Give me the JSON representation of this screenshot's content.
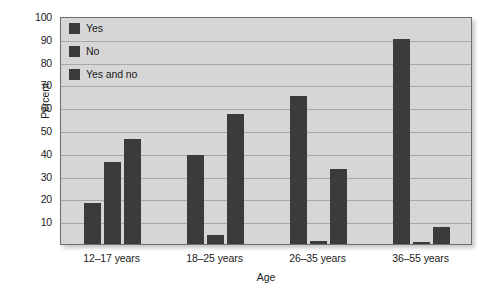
{
  "chart_data": {
    "type": "bar",
    "title": "",
    "subtitle": "",
    "xlabel": "Age",
    "ylabel": "Percent",
    "categories": [
      "12–17 years",
      "18–25 years",
      "26–35 years",
      "36–55 years"
    ],
    "series": [
      {
        "name": "Yes",
        "values": [
          18,
          39,
          65,
          90
        ]
      },
      {
        "name": "No",
        "values": [
          36,
          4,
          1.5,
          1
        ]
      },
      {
        "name": "Yes and no",
        "values": [
          46,
          57,
          33,
          7.5
        ]
      }
    ],
    "ylim": [
      0,
      100
    ],
    "ytick_labels": [
      "100",
      "90",
      "80",
      "70",
      "60",
      "50",
      "40",
      "30",
      "20",
      "10"
    ],
    "ytick_values": [
      100,
      90,
      80,
      70,
      60,
      50,
      40,
      30,
      20,
      10
    ],
    "grid": true,
    "grid_axis": "y",
    "legend_position": "top-left",
    "legend_entries": [
      "Yes",
      "No",
      "Yes and no"
    ],
    "bar_color": "#3b3b3b",
    "plot_background": "#d6d6d6",
    "gridline_color": "#a8a8a8",
    "page_background": "#ffffff"
  }
}
